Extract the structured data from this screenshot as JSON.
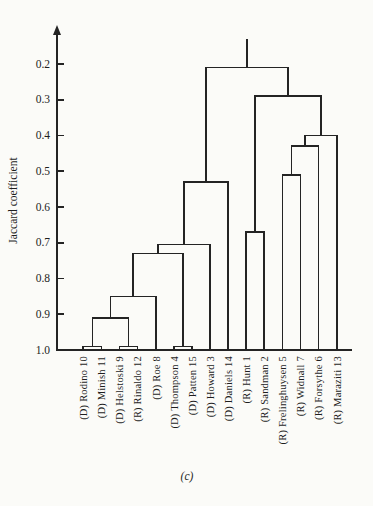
{
  "figure": {
    "caption": "(c)"
  },
  "chart_data": {
    "type": "dendrogram",
    "title": "",
    "ylabel": "Jaccard coefficient",
    "yticks": [
      "0.2",
      "0.3",
      "0.4",
      "0.5",
      "0.6",
      "0.7",
      "0.8",
      "0.9",
      "1.0"
    ],
    "yaxis": {
      "top_value": 0.2,
      "bottom_value": 1.0,
      "note": "values increase downward; leaves start at 1.0; axis arrow points up",
      "grid": false
    },
    "leaves": [
      "(D) Rodino 10",
      "(D) Minish 11",
      "(D) Helstoski 9",
      "(R) Rinaldo 12",
      "(D) Roe 8",
      "(D) Thompson 4",
      "(D) Patten 15",
      "(D) Howard 3",
      "(D) Daniels 14",
      "(R) Hunt 1",
      "(R) Sandman 2",
      "(R) Frelinghuysen 5",
      "(R) Widnall 7",
      "(R) Forsythe 6",
      "(R) Maraziti 13"
    ],
    "merges_note": "each merge is [nodeA, nodeB, jaccard_height]; leaves are nodes 0-14, merge i creates node 15+i",
    "merges": [
      [
        0,
        1,
        0.99
      ],
      [
        2,
        3,
        0.99
      ],
      [
        15,
        16,
        0.91
      ],
      [
        17,
        4,
        0.85
      ],
      [
        5,
        6,
        0.99
      ],
      [
        18,
        19,
        0.73
      ],
      [
        20,
        7,
        0.705
      ],
      [
        21,
        8,
        0.53
      ],
      [
        9,
        10,
        0.67
      ],
      [
        11,
        12,
        0.51
      ],
      [
        24,
        13,
        0.43
      ],
      [
        25,
        14,
        0.4
      ],
      [
        23,
        26,
        0.29
      ],
      [
        22,
        27,
        0.21
      ]
    ],
    "root_stub_top_value": 0.13
  }
}
